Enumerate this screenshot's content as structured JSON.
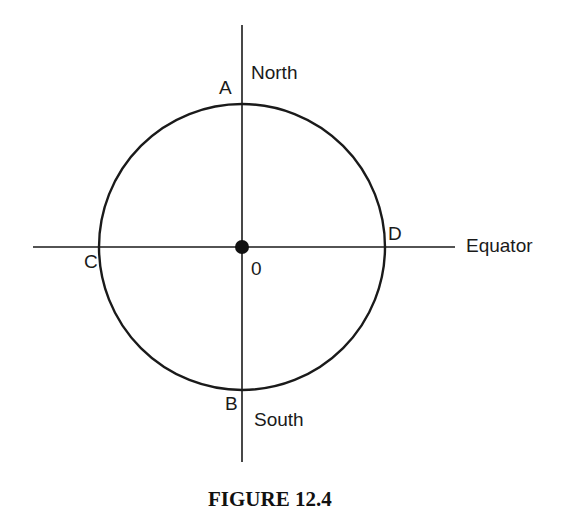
{
  "figure": {
    "caption": "FIGURE 12.4",
    "points": {
      "A": "A",
      "B": "B",
      "C": "C",
      "D": "D",
      "O": "0"
    },
    "labels": {
      "north": "North",
      "south": "South",
      "equator": "Equator"
    },
    "colors": {
      "stroke": "#1a1a1a",
      "background": "#ffffff"
    }
  }
}
